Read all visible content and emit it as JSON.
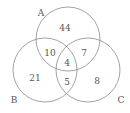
{
  "diagram": {
    "type": "venn-3-set",
    "stroke_color": "#8a8a8a",
    "text_color": "#555555",
    "sets": [
      {
        "label": "A",
        "cx": 68,
        "cy": 39,
        "r": 32,
        "label_x": 41,
        "label_y": 16
      },
      {
        "label": "B",
        "cx": 45,
        "cy": 70,
        "r": 32,
        "label_x": 14,
        "label_y": 103
      },
      {
        "label": "C",
        "cx": 88,
        "cy": 70,
        "r": 32,
        "label_x": 121,
        "label_y": 103
      }
    ],
    "regions": [
      {
        "id": "A_only",
        "value": "44",
        "x": 65,
        "y": 31
      },
      {
        "id": "A_and_B_only",
        "value": "10",
        "x": 50,
        "y": 56
      },
      {
        "id": "A_and_C_only",
        "value": "7",
        "x": 84,
        "y": 56
      },
      {
        "id": "A_and_B_and_C",
        "value": "4",
        "x": 67,
        "y": 66
      },
      {
        "id": "B_only",
        "value": "21",
        "x": 35,
        "y": 81
      },
      {
        "id": "B_and_C_only",
        "value": "5",
        "x": 67,
        "y": 85
      },
      {
        "id": "C_only",
        "value": "8",
        "x": 97,
        "y": 84
      }
    ]
  }
}
